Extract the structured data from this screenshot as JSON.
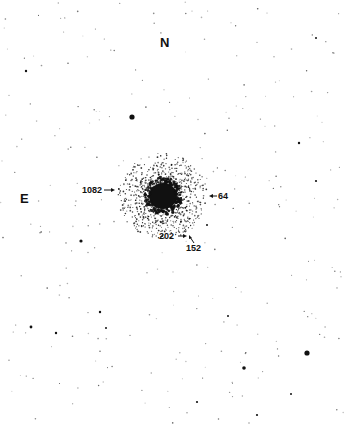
{
  "chart_data": {
    "type": "scatter",
    "title": "",
    "orientation": {
      "north": "N",
      "east": "E"
    },
    "cluster": {
      "cx": 163,
      "cy": 196,
      "core_radius": 14,
      "halo_radius": 45
    },
    "labeled_stars": [
      {
        "id": "1082",
        "x": 116,
        "y": 190,
        "label_x": 83,
        "label_y": 186,
        "arrow": "right"
      },
      {
        "id": "64",
        "x": 210,
        "y": 196,
        "label_x": 218,
        "label_y": 192,
        "arrow": "left"
      },
      {
        "id": "202",
        "x": 187,
        "y": 236,
        "label_x": 160,
        "label_y": 232,
        "arrow": "right"
      },
      {
        "id": "152",
        "x": 190,
        "y": 235,
        "label_x": 186,
        "label_y": 244,
        "arrow": "up-left"
      }
    ],
    "bright_stars": [
      {
        "x": 132,
        "y": 117,
        "r": 2.6
      },
      {
        "x": 307,
        "y": 353,
        "r": 2.6
      },
      {
        "x": 244,
        "y": 368,
        "r": 1.8
      },
      {
        "x": 81,
        "y": 241,
        "r": 1.6
      },
      {
        "x": 31,
        "y": 327,
        "r": 1.4
      },
      {
        "x": 26,
        "y": 71,
        "r": 1.2
      },
      {
        "x": 299,
        "y": 143,
        "r": 1.2
      },
      {
        "x": 100,
        "y": 312,
        "r": 1.2
      },
      {
        "x": 56,
        "y": 333,
        "r": 1.2
      },
      {
        "x": 197,
        "y": 402,
        "r": 1.1
      },
      {
        "x": 257,
        "y": 415,
        "r": 1.1
      },
      {
        "x": 316,
        "y": 181,
        "r": 1.1
      },
      {
        "x": 291,
        "y": 394,
        "r": 1.0
      },
      {
        "x": 228,
        "y": 316,
        "r": 1.0
      },
      {
        "x": 207,
        "y": 225,
        "r": 1.0
      },
      {
        "x": 106,
        "y": 328,
        "r": 1.0
      },
      {
        "x": 316,
        "y": 38,
        "r": 1.0
      }
    ],
    "xlabel": "",
    "ylabel": "",
    "xlim": [
      0,
      347
    ],
    "ylim": [
      0,
      427
    ],
    "grid": false
  },
  "labels": {
    "north": "N",
    "east": "E",
    "star_1082": "1082",
    "star_64": "64",
    "star_202": "202",
    "star_152": "152"
  },
  "colors": {
    "background": "#ffffff",
    "ink": "#111111"
  }
}
